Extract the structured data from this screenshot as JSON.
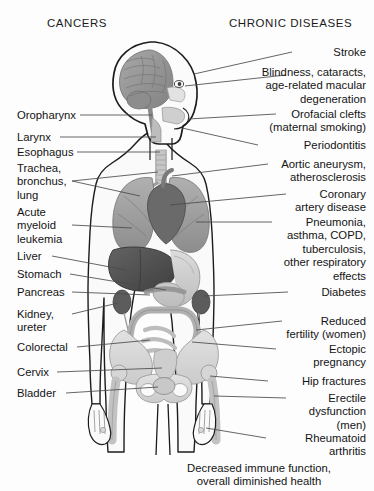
{
  "headers": {
    "left": "CANCERS",
    "right": "CHRONIC DISEASES"
  },
  "left_labels": [
    {
      "text": "Oropharynx",
      "y": 109
    },
    {
      "text": "Larynx",
      "y": 131
    },
    {
      "text": "Esophagus",
      "y": 146
    },
    {
      "text": "Trachea,\nbronchus,\nlung",
      "y": 162
    },
    {
      "text": "Acute\nmyeloid\nleukemia",
      "y": 206
    },
    {
      "text": "Liver",
      "y": 250
    },
    {
      "text": "Stomach",
      "y": 268
    },
    {
      "text": "Pancreas",
      "y": 286
    },
    {
      "text": "Kidney,\nureter",
      "y": 308
    },
    {
      "text": "Colorectal",
      "y": 341
    },
    {
      "text": "Cervix",
      "y": 366
    },
    {
      "text": "Bladder",
      "y": 387
    }
  ],
  "right_labels": [
    {
      "text": "Stroke",
      "y": 46
    },
    {
      "text": "Blindness, cataracts,\nage-related macular\ndegeneration",
      "y": 66
    },
    {
      "text": "Orofacial clefts\n(maternal smoking)",
      "y": 108
    },
    {
      "text": "Periodontitis",
      "y": 139
    },
    {
      "text": "Aortic aneurysm,\natherosclerosis",
      "y": 158
    },
    {
      "text": "Coronary\nartery disease",
      "y": 188
    },
    {
      "text": "Pneumonia,\nasthma, COPD,\ntuberculosis,\nother respiratory\neffects",
      "y": 216
    },
    {
      "text": "Diabetes",
      "y": 286
    },
    {
      "text": "Reduced\nfertility (women)",
      "y": 315
    },
    {
      "text": "Ectopic\npregnancy",
      "y": 343
    },
    {
      "text": "Hip fractures",
      "y": 375
    },
    {
      "text": "Erectile\ndysfunction\n(men)",
      "y": 392
    },
    {
      "text": "Rheumatoid\narthritis",
      "y": 432
    }
  ],
  "footer": {
    "text": "Decreased immune function,\noverall diminished health",
    "y": 462
  },
  "colors": {
    "background": "#fdfdfd",
    "text": "#141414",
    "outline": "#1c1c1c",
    "leader_line": "#4a4a4a",
    "brain": "#9a9a9a",
    "brain_shadow": "#7e7e7e",
    "lung": "#a3a3a3",
    "lung_dark": "#8e8e8e",
    "heart": "#6e6e6e",
    "liver": "#555555",
    "stomach": "#cfcfcf",
    "intestine": "#b6b6b6",
    "kidney": "#5f5f5f",
    "bone": "#d8d8d8",
    "bone_line": "#8a8a8a",
    "skin": "#f2f2f2"
  }
}
